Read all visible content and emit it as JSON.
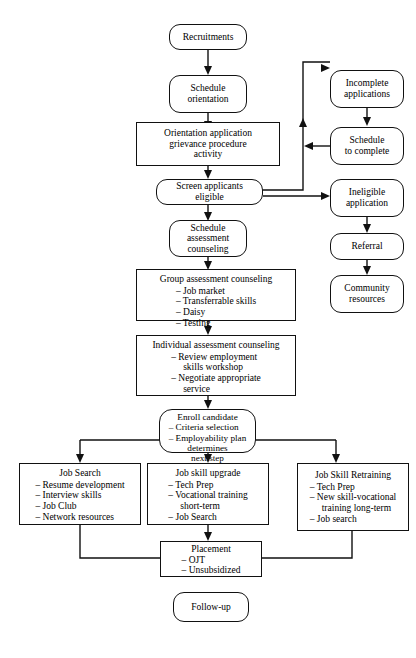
{
  "diagram": {
    "style": {
      "line_color": "#111111",
      "box_fill": "#ffffff",
      "text_color": "#000000"
    },
    "nodes": {
      "recruitments": {
        "label": "Recruitments"
      },
      "schedule_orientation": {
        "line1": "Schedule",
        "line2": "orientation"
      },
      "orientation_activity": {
        "line1": "Orientation application",
        "line2": "grievance procedure",
        "line3": "activity"
      },
      "screen_applicants": {
        "line1": "Screen applicants",
        "line2": "eligible"
      },
      "schedule_assessment": {
        "line1": "Schedule",
        "line2": "assessment",
        "line3": "counseling"
      },
      "group_assessment": {
        "title": "Group assessment counseling",
        "items": [
          "Job market",
          "Transferrable skills",
          "Daisy",
          "Testing"
        ]
      },
      "individual_assessment": {
        "title": "Individual assessment counseling",
        "items": [
          "Review employment",
          "Negotiate appropriate"
        ],
        "item_subs": [
          "skills workshop",
          "service"
        ]
      },
      "enroll_candidate": {
        "title": "Enroll candidate",
        "items": [
          "Criteria selection",
          "Employability plan"
        ],
        "tail1": "determines",
        "tail2": "next step"
      },
      "job_search": {
        "title": "Job Search",
        "items": [
          "Resume development",
          "Interview skills",
          "Job Club",
          "Network resources"
        ]
      },
      "job_skill_upgrade": {
        "title": "Job skill upgrade",
        "items": [
          "Tech Prep",
          "Vocational training",
          "Job Search"
        ],
        "sub_after_2": "short-term"
      },
      "job_skill_retraining": {
        "title": "Job Skill Retraining",
        "items": [
          "Tech Prep",
          "New skill-vocational",
          "Job search"
        ],
        "sub_after_2": "training long-term"
      },
      "placement": {
        "title": "Placement",
        "items": [
          "OJT",
          "Unsubsidized"
        ]
      },
      "follow_up": {
        "label": "Follow-up"
      },
      "incomplete_applications": {
        "line1": "Incomplete",
        "line2": "applications"
      },
      "schedule_to_complete": {
        "line1": "Schedule",
        "line2": "to complete"
      },
      "ineligible_application": {
        "line1": "Ineligible",
        "line2": "application"
      },
      "referral": {
        "label": "Referral"
      },
      "community_resources": {
        "line1": "Community",
        "line2": "resources"
      }
    }
  }
}
